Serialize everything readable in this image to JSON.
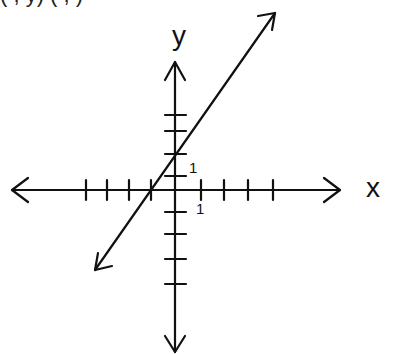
{
  "diagram": {
    "type": "coordinate-plane-line-graph",
    "top_text_cutoff": "(   ,  y)  (   ,   )",
    "x_axis_label": "x",
    "y_axis_label": "y",
    "tick_labels": {
      "y_pos_1": "1",
      "x_pos_1": "1"
    },
    "x_ticks": [
      -4,
      -3,
      -2,
      -1,
      1,
      2,
      3,
      4
    ],
    "y_ticks": [
      -4,
      -3,
      -2,
      -1,
      1,
      2,
      3,
      4
    ],
    "line": {
      "description": "straight line with arrows at both ends, positive slope",
      "y_intercept": 2,
      "x_intercept": -1,
      "slope_approx": 1.5
    },
    "colors": {
      "stroke": "#111111",
      "background": "#ffffff"
    }
  }
}
